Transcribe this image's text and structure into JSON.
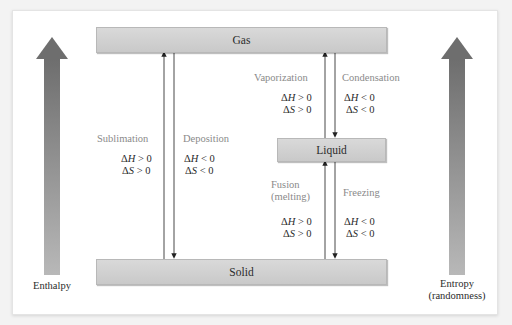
{
  "states": {
    "gas": "Gas",
    "liquid": "Liquid",
    "solid": "Solid"
  },
  "axes": {
    "left": "Enthalpy",
    "right_line1": "Entropy",
    "right_line2": "(randomness)"
  },
  "transitions": {
    "sublimation": {
      "label": "Sublimation",
      "dH": "ΔH > 0",
      "dS": "ΔS > 0",
      "direction": "up"
    },
    "deposition": {
      "label": "Deposition",
      "dH": "ΔH < 0",
      "dS": "ΔS < 0",
      "direction": "down"
    },
    "vaporization": {
      "label": "Vaporization",
      "dH": "ΔH > 0",
      "dS": "ΔS > 0",
      "direction": "up"
    },
    "condensation": {
      "label": "Condensation",
      "dH": "ΔH < 0",
      "dS": "ΔS < 0",
      "direction": "down"
    },
    "fusion": {
      "label_line1": "Fusion",
      "label_line2": "(melting)",
      "dH": "ΔH > 0",
      "dS": "ΔS > 0",
      "direction": "up"
    },
    "freezing": {
      "label": "Freezing",
      "dH": "ΔH < 0",
      "dS": "ΔS < 0",
      "direction": "down"
    }
  },
  "colors": {
    "bar_fill": "#d0d0d0",
    "arrow_dark": "#6e6e6e",
    "arrow_light": "#b5b5b5",
    "process_label": "#8a8a8a",
    "text": "#2b2b2b"
  }
}
